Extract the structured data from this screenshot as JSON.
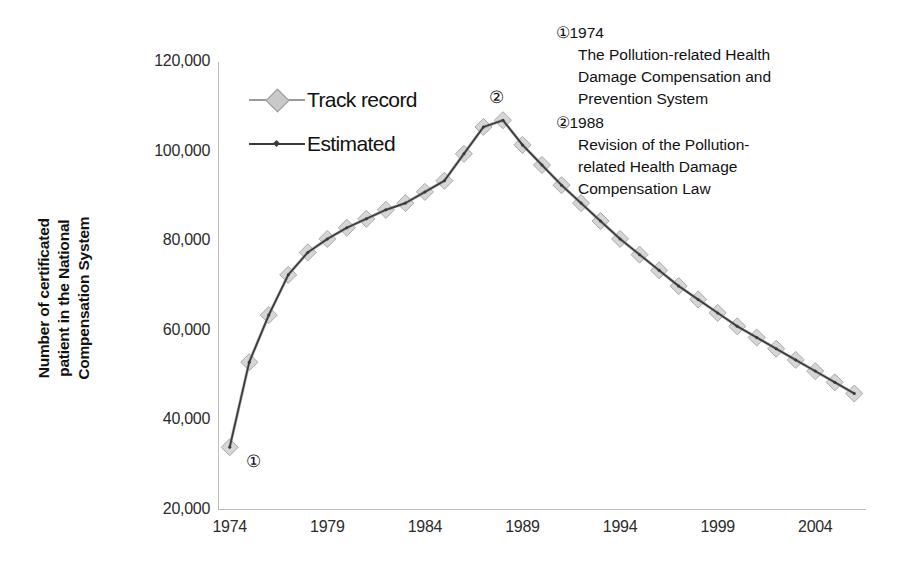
{
  "chart_data": {
    "type": "line",
    "title": "",
    "xlabel": "",
    "ylabel": "Number of certificated patient in the National Compensation System",
    "ylabel_lines": [
      "Number of certificated",
      "patient in the National",
      "Compensation System"
    ],
    "xlim": [
      1973.4,
      2006.6
    ],
    "ylim": [
      20000,
      120000
    ],
    "yticks": [
      120000,
      100000,
      80000,
      60000,
      40000,
      20000
    ],
    "ytick_labels": [
      "120,000",
      "100,000",
      "80,000",
      "60,000",
      "40,000",
      "20,000"
    ],
    "xticks": [
      1974,
      1979,
      1984,
      1989,
      1994,
      1999,
      2004
    ],
    "xtick_labels": [
      "1974",
      "1979",
      "1984",
      "1989",
      "1994",
      "1999",
      "2004"
    ],
    "grid": false,
    "legend_position": "upper-left-inside",
    "series": [
      {
        "name": "Track record",
        "marker": "diamond",
        "color": "#9a9a9a",
        "x": [
          1974,
          1975,
          1976,
          1977,
          1978,
          1979,
          1980,
          1981,
          1982,
          1983,
          1984,
          1985,
          1986,
          1987,
          1988,
          1989,
          1990,
          1991,
          1992,
          1993,
          1994,
          1995,
          1996,
          1997,
          1998,
          1999,
          2000,
          2001,
          2002,
          2003,
          2004,
          2005,
          2006
        ],
        "values": [
          34000,
          53000,
          63500,
          72500,
          77500,
          80500,
          83000,
          85000,
          87000,
          88500,
          91000,
          93500,
          99500,
          105500,
          107000,
          101500,
          97000,
          92500,
          88500,
          84500,
          80500,
          77000,
          73500,
          70000,
          67000,
          64000,
          61000,
          58500,
          56000,
          53500,
          51000,
          48500,
          46000
        ]
      },
      {
        "name": "Estimated",
        "marker": "none",
        "color": "#3a3a3a",
        "x": [
          1974,
          1975,
          1976,
          1977,
          1978,
          1979,
          1980,
          1981,
          1982,
          1983,
          1984,
          1985,
          1986,
          1987,
          1988,
          1989,
          1990,
          1991,
          1992,
          1993,
          1994,
          1995,
          1996,
          1997,
          1998,
          1999,
          2000,
          2001,
          2002,
          2003,
          2004,
          2005,
          2006
        ],
        "values": [
          34000,
          53000,
          63500,
          72500,
          77500,
          80500,
          83000,
          85000,
          87000,
          88500,
          91000,
          93500,
          99500,
          105500,
          107000,
          101500,
          97000,
          92500,
          88500,
          84500,
          80500,
          77000,
          73500,
          70000,
          67000,
          64000,
          61000,
          58500,
          56000,
          53500,
          51000,
          48500,
          46000
        ]
      }
    ],
    "point_annotations": [
      {
        "label": "①",
        "x": 1974,
        "y": 34000
      },
      {
        "label": "②",
        "x": 1987,
        "y": 105500
      }
    ],
    "annotations": [
      {
        "marker": "①",
        "year": "1974",
        "lines": [
          "The Pollution-related Health",
          "Damage Compensation and",
          "Prevention System"
        ]
      },
      {
        "marker": "②",
        "year": "1988",
        "lines": [
          "Revision of the Pollution-",
          "related Health Damage",
          "Compensation Law"
        ]
      }
    ]
  },
  "legend": {
    "items": [
      {
        "label": "Track record",
        "marker": "diamond",
        "color": "#9a9a9a"
      },
      {
        "label": "Estimated",
        "marker": "line",
        "color": "#3a3a3a"
      }
    ]
  },
  "colors": {
    "axis": "#bdbdbd",
    "track_record": "#9a9a9a",
    "estimated": "#3a3a3a",
    "text": "#111111",
    "background": "#ffffff"
  }
}
